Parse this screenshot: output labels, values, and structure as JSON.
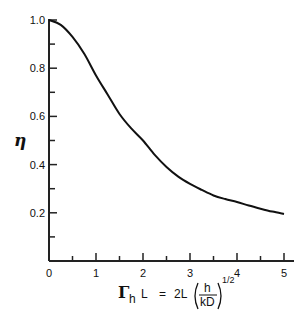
{
  "chart_data": {
    "type": "line",
    "title": "",
    "xlabel": "Γh L = 2L (h/kD)^1/2",
    "ylabel": "η",
    "xlim": [
      0,
      5
    ],
    "ylim": [
      0,
      1.0
    ],
    "x_ticks": [
      "0",
      "1",
      "2",
      "3",
      "4",
      "5"
    ],
    "x_minor_ticks": [
      0.5,
      1.5,
      2.5,
      3.5,
      4.5
    ],
    "y_ticks": [
      "0.2",
      "0.4",
      "0.6",
      "0.8",
      "1.0"
    ],
    "y_minor_ticks": [
      0.1,
      0.3,
      0.5,
      0.7,
      0.9
    ],
    "grid": false,
    "legend": null,
    "series": [
      {
        "name": "η",
        "x": [
          0,
          0.25,
          0.5,
          0.75,
          1.0,
          1.25,
          1.5,
          1.75,
          2.0,
          2.25,
          2.5,
          2.75,
          3.0,
          3.25,
          3.5,
          3.75,
          4.0,
          4.25,
          4.5,
          4.75,
          5.0
        ],
        "values": [
          1.0,
          0.98,
          0.93,
          0.86,
          0.77,
          0.69,
          0.61,
          0.55,
          0.5,
          0.44,
          0.39,
          0.35,
          0.32,
          0.295,
          0.272,
          0.257,
          0.245,
          0.23,
          0.217,
          0.205,
          0.195
        ]
      }
    ]
  },
  "labels": {
    "y_axis": "η",
    "x_axis_gamma": "Γ",
    "x_axis_sub": "h",
    "x_axis_L": "L",
    "x_axis_eq": "=",
    "x_axis_2L": "2L",
    "x_axis_num": "h",
    "x_axis_den": "kD",
    "x_axis_exp": "1/2"
  },
  "colors": {
    "line": "#111111",
    "axis": "#222222",
    "background": "#ffffff"
  }
}
